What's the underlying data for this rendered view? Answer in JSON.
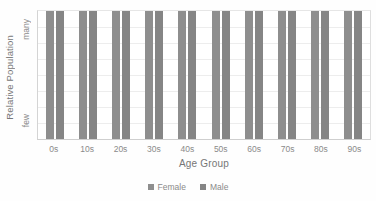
{
  "chart_data": {
    "type": "bar",
    "title": "",
    "subtitle": "",
    "xlabel": "Age Group",
    "ylabel": "Relative Population",
    "categories": [
      "0s",
      "10s",
      "20s",
      "30s",
      "40s",
      "50s",
      "60s",
      "70s",
      "80s",
      "90s"
    ],
    "series": [
      {
        "name": "Female",
        "color": "#8e8e8e",
        "values": [
          100,
          100,
          100,
          100,
          100,
          100,
          100,
          100,
          100,
          100
        ]
      },
      {
        "name": "Male",
        "color": "#858585",
        "values": [
          100,
          100,
          100,
          100,
          100,
          100,
          100,
          100,
          100,
          100
        ]
      }
    ],
    "ylim": [
      0,
      100
    ],
    "y_tick_labels": [
      "few",
      "many"
    ],
    "y_tick_label_low": "few",
    "y_tick_label_high": "many",
    "grid": true,
    "gridline_count": 7,
    "legend_position": "bottom",
    "legend_entries": [
      "Female",
      "Male"
    ],
    "annotations": []
  },
  "axes": {
    "y_title": "Relative Population",
    "y_label_high": "many",
    "y_label_low": "few",
    "x_title": "Age Group",
    "x_tick_labels": [
      "0s",
      "10s",
      "20s",
      "30s",
      "40s",
      "50s",
      "60s",
      "70s",
      "80s",
      "90s"
    ]
  },
  "legend": {
    "items": [
      {
        "label": "Female",
        "color": "#8e8e8e"
      },
      {
        "label": "Male",
        "color": "#858585"
      }
    ]
  },
  "colors": {
    "female": "#8e8e8e",
    "male": "#858585",
    "gridline": "#ededed",
    "axis": "#d4d4d4",
    "text": "#8a8a8a",
    "background": "#ffffff"
  }
}
